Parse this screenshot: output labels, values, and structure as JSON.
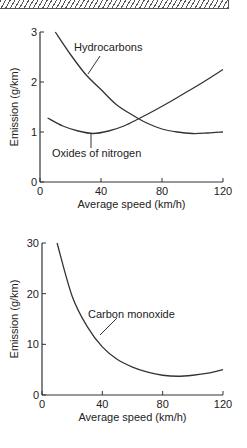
{
  "chart_data": [
    {
      "type": "line",
      "title": "",
      "xlabel": "Average speed (km/h)",
      "ylabel": "Emission (g/km)",
      "xlim": [
        0,
        120
      ],
      "ylim": [
        0,
        3
      ],
      "xticks": [
        "0",
        "40",
        "80",
        "120"
      ],
      "yticks": [
        "0",
        "1",
        "2",
        "3"
      ],
      "grid": false,
      "series": [
        {
          "name": "Hydrocarbons",
          "x": [
            10,
            20,
            30,
            40,
            50,
            60,
            70,
            80,
            90,
            100,
            110,
            120
          ],
          "values": [
            3.0,
            2.55,
            2.15,
            1.85,
            1.55,
            1.35,
            1.18,
            1.06,
            1.0,
            0.97,
            0.98,
            1.0
          ]
        },
        {
          "name": "Oxides of nitrogen",
          "x": [
            5,
            15,
            25,
            35,
            45,
            55,
            65,
            75,
            85,
            95,
            105,
            120
          ],
          "values": [
            1.28,
            1.12,
            1.02,
            0.97,
            1.02,
            1.12,
            1.27,
            1.43,
            1.6,
            1.78,
            1.96,
            2.25
          ]
        }
      ],
      "annotations": [
        "Hydrocarbons",
        "Oxides of nitrogen"
      ]
    },
    {
      "type": "line",
      "title": "",
      "xlabel": "Average speed (km/h)",
      "ylabel": "Emission (g/km)",
      "xlim": [
        0,
        120
      ],
      "ylim": [
        0,
        30
      ],
      "xticks": [
        "0",
        "40",
        "80",
        "120"
      ],
      "yticks": [
        "0",
        "10",
        "20",
        "30"
      ],
      "grid": false,
      "series": [
        {
          "name": "Carbon monoxide",
          "x": [
            10,
            20,
            30,
            40,
            50,
            60,
            70,
            80,
            90,
            100,
            110,
            120
          ],
          "values": [
            30,
            19.5,
            13.5,
            9.5,
            7.0,
            5.5,
            4.5,
            3.9,
            3.7,
            3.9,
            4.3,
            5.0
          ]
        }
      ],
      "annotations": [
        "Carbon monoxide"
      ]
    }
  ]
}
